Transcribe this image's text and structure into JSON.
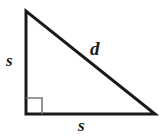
{
  "figure": {
    "type": "right-triangle-diagram",
    "background_color": "#ffffff",
    "stroke_color": "#1a1a1a",
    "right_angle_marker_color": "#7a7a7a",
    "stroke_width": 3,
    "right_angle_marker_width": 1.6,
    "vertices": {
      "top_left": {
        "x": 26,
        "y": 11
      },
      "bottom_left": {
        "x": 26,
        "y": 114
      },
      "bottom_right": {
        "x": 155,
        "y": 114
      }
    },
    "right_angle_marker": {
      "size": 16,
      "corner_x": 26,
      "corner_y": 114
    },
    "labels": {
      "vertical_leg": "s",
      "horizontal_leg": "s",
      "hypotenuse": "d"
    }
  }
}
